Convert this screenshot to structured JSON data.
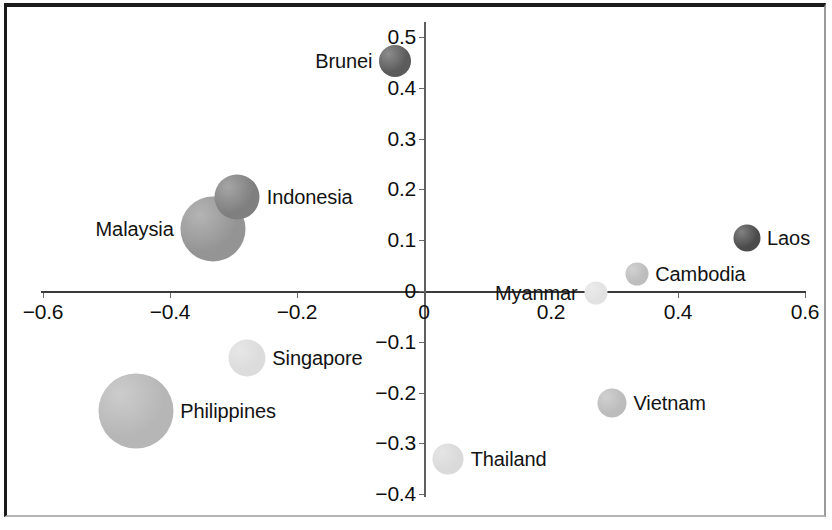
{
  "chart_data": {
    "type": "scatter",
    "title": "",
    "subtitle": "",
    "xlabel": "",
    "ylabel": "",
    "xlim": [
      -0.6,
      0.6
    ],
    "ylim": [
      -0.4,
      0.5
    ],
    "grid": false,
    "legend": "none",
    "x_ticks": [
      "−0.6",
      "−0.4",
      "−0.2",
      "0",
      "0.2",
      "0.4",
      "0.6"
    ],
    "x_tick_values": [
      -0.6,
      -0.4,
      -0.2,
      0,
      0.2,
      0.4,
      0.6
    ],
    "y_ticks": [
      "0.5",
      "0.4",
      "0.3",
      "0.2",
      "0.1",
      "0",
      "−0.1",
      "−0.2",
      "−0.3",
      "−0.4"
    ],
    "y_tick_values": [
      0.5,
      0.4,
      0.3,
      0.2,
      0.1,
      0,
      -0.1,
      -0.2,
      -0.3,
      -0.4
    ],
    "points": [
      {
        "name": "Brunei",
        "x": -0.045,
        "y": 0.452,
        "size": 32,
        "shade": "#5b5b5b",
        "label_side": "left"
      },
      {
        "name": "Indonesia",
        "x": -0.294,
        "y": 0.185,
        "size": 45,
        "shade": "#7f7f7f",
        "label_side": "right"
      },
      {
        "name": "Malaysia",
        "x": -0.332,
        "y": 0.123,
        "size": 65,
        "shade": "#949494",
        "label_side": "left"
      },
      {
        "name": "Laos",
        "x": 0.508,
        "y": 0.104,
        "size": 27,
        "shade": "#4b4b4b",
        "label_side": "right"
      },
      {
        "name": "Cambodia",
        "x": 0.335,
        "y": 0.033,
        "size": 23,
        "shade": "#bdbdbd",
        "label_side": "right"
      },
      {
        "name": "Myanmar",
        "x": 0.271,
        "y": -0.004,
        "size": 23,
        "shade": "#e2e2e2",
        "label_side": "left"
      },
      {
        "name": "Singapore",
        "x": -0.279,
        "y": -0.131,
        "size": 37,
        "shade": "#dcdcdc",
        "label_side": "right"
      },
      {
        "name": "Vietnam",
        "x": 0.296,
        "y": -0.22,
        "size": 29,
        "shade": "#bcbcbc",
        "label_side": "right"
      },
      {
        "name": "Philippines",
        "x": -0.454,
        "y": -0.237,
        "size": 75,
        "shade": "#b6b6b6",
        "label_side": "right"
      },
      {
        "name": "Thailand",
        "x": 0.038,
        "y": -0.331,
        "size": 31,
        "shade": "#dadada",
        "label_side": "right"
      }
    ]
  },
  "geometry": {
    "origin_x_px": 424,
    "origin_y_px": 291,
    "px_per_x_unit": 635,
    "px_per_y_unit": 508,
    "x_axis_left_px": 41,
    "x_axis_right_px": 806,
    "y_axis_top_px": 22,
    "y_axis_bottom_px": 497
  }
}
